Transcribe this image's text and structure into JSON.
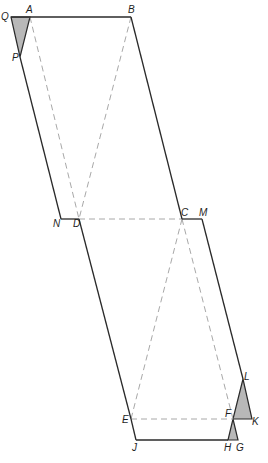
{
  "diagram": {
    "type": "geometric-net",
    "colors": {
      "solid_line": "#2a2a2a",
      "dashed_line": "#a8a8a8",
      "shade": "#b8b8b8",
      "background": "#ffffff"
    },
    "points": {
      "Q": [
        11,
        17
      ],
      "A": [
        30,
        17
      ],
      "B": [
        131,
        17
      ],
      "P": [
        20,
        57
      ],
      "N": [
        61,
        219
      ],
      "D": [
        79,
        219
      ],
      "C": [
        182,
        219
      ],
      "M": [
        202,
        219
      ],
      "E": [
        131,
        419
      ],
      "F": [
        233,
        419
      ],
      "K": [
        252,
        419
      ],
      "L": [
        243,
        379
      ],
      "J": [
        136,
        440
      ],
      "H": [
        228,
        440
      ],
      "G": [
        238,
        440
      ]
    },
    "labels": [
      {
        "text": "Q",
        "x": 1,
        "y": 20
      },
      {
        "text": "A",
        "x": 26,
        "y": 13
      },
      {
        "text": "B",
        "x": 128,
        "y": 13
      },
      {
        "text": "P",
        "x": 12,
        "y": 61
      },
      {
        "text": "N",
        "x": 53,
        "y": 227
      },
      {
        "text": "D",
        "x": 73,
        "y": 227
      },
      {
        "text": "C",
        "x": 181,
        "y": 216
      },
      {
        "text": "M",
        "x": 199,
        "y": 216
      },
      {
        "text": "E",
        "x": 122,
        "y": 423
      },
      {
        "text": "F",
        "x": 225,
        "y": 417
      },
      {
        "text": "K",
        "x": 252,
        "y": 425
      },
      {
        "text": "L",
        "x": 244,
        "y": 380
      },
      {
        "text": "J",
        "x": 132,
        "y": 451
      },
      {
        "text": "H",
        "x": 224,
        "y": 451
      },
      {
        "text": "G",
        "x": 236,
        "y": 451
      }
    ],
    "solid_segments": [
      [
        "Q",
        "B"
      ],
      [
        "B",
        "C"
      ],
      [
        "C",
        "M"
      ],
      [
        "M",
        "L"
      ],
      [
        "P",
        "N"
      ],
      [
        "N",
        "D"
      ],
      [
        "D",
        "E"
      ],
      [
        "E",
        "J"
      ],
      [
        "J",
        "H"
      ]
    ],
    "dashed_segments": [
      [
        "A",
        "D"
      ],
      [
        "B",
        "D"
      ],
      [
        "D",
        "C"
      ],
      [
        "C",
        "E"
      ],
      [
        "C",
        "F"
      ],
      [
        "E",
        "F"
      ]
    ],
    "shaded_triangles": [
      [
        "Q",
        "A",
        "P"
      ],
      [
        "F",
        "K",
        "L"
      ],
      [
        "F",
        "G",
        "H"
      ]
    ]
  }
}
